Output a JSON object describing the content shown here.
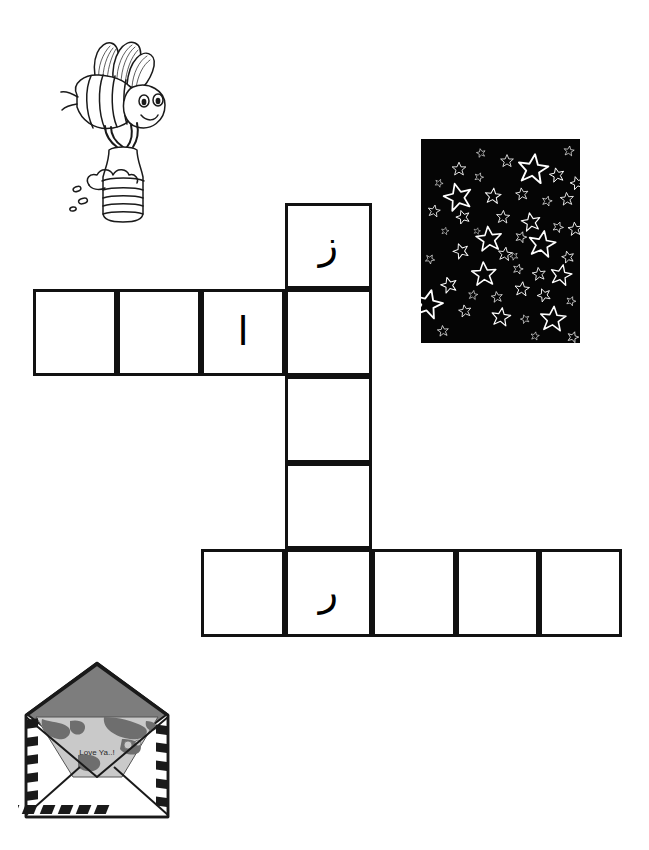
{
  "page": {
    "background_color": "#ffffff",
    "width": 649,
    "height": 850
  },
  "puzzle": {
    "name": "arabic-letter-crossword",
    "ink_color": "#111111",
    "cell_size": 87,
    "across_top": {
      "label": "top-across-word",
      "cell_count": 4,
      "cells": [
        {
          "index": 0,
          "letter": "",
          "filled": false
        },
        {
          "index": 1,
          "letter": "",
          "filled": false
        },
        {
          "index": 2,
          "letter": "ا",
          "filled": true,
          "letter_name": "alif"
        },
        {
          "index": 3,
          "letter": "",
          "filled": false,
          "shared_with": "down-word"
        }
      ]
    },
    "down_word": {
      "label": "down-word",
      "cell_count": 5,
      "cells": [
        {
          "index": 0,
          "letter": "ز",
          "filled": true,
          "letter_name": "zay"
        },
        {
          "index": 1,
          "letter": "",
          "filled": false,
          "shared_with": "top-across-word"
        },
        {
          "index": 2,
          "letter": "",
          "filled": false
        },
        {
          "index": 3,
          "letter": "",
          "filled": false
        },
        {
          "index": 4,
          "letter": "ر",
          "filled": true,
          "letter_name": "ra",
          "shared_with": "bottom-across-word"
        }
      ]
    },
    "across_bottom": {
      "label": "bottom-across-word",
      "cell_count": 5,
      "cells": [
        {
          "index": 0,
          "letter": "",
          "filled": false
        },
        {
          "index": 1,
          "letter": "ر",
          "filled": true,
          "letter_name": "ra",
          "shared_with": "down-word"
        },
        {
          "index": 2,
          "letter": "",
          "filled": false
        },
        {
          "index": 3,
          "letter": "",
          "filled": false
        },
        {
          "index": 4,
          "letter": "",
          "filled": false
        }
      ]
    }
  },
  "pictures": {
    "bee": {
      "name": "bee-with-honey-pot",
      "description": "Cartoon bee carrying a striped honey pot",
      "line_color": "#1a1a1a",
      "fill_color": "#ffffff"
    },
    "stars": {
      "name": "night-sky-stars",
      "description": "Black square filled with white outlined stars",
      "background_color": "#050505",
      "star_color": "#ffffff",
      "star_count": 48
    },
    "envelope": {
      "name": "open-airmail-envelope",
      "description": "Open airmail envelope with a world-map letter inside",
      "letter_text": "Love Ya..!",
      "flap_color": "#7d7d7d",
      "map_light": "#c9c9c9",
      "map_dark": "#6e6e6e",
      "border_color": "#1a1a1a",
      "paper_color": "#ffffff"
    }
  }
}
